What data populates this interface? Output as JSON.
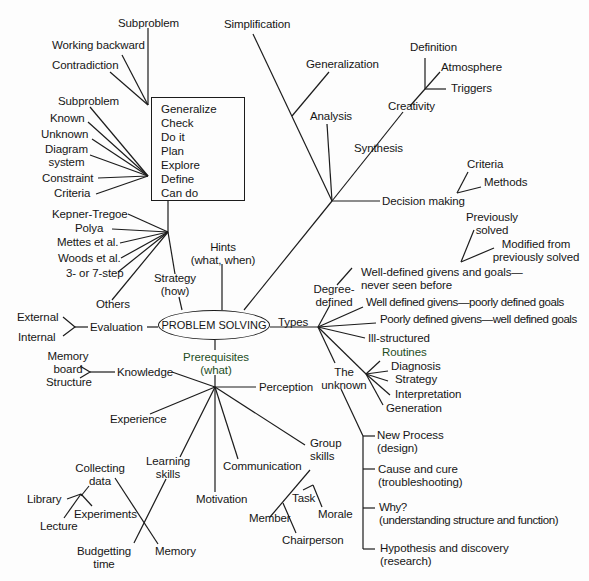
{
  "center": {
    "label": "PROBLEM SOLVING"
  },
  "strategy": {
    "label": "Strategy\n(how)",
    "label_line1": "Strategy",
    "label_line2": "(how)",
    "methods": [
      "Kepner-Tregoe",
      "Polya",
      "Mettes et al.",
      "Woods et al.",
      "3- or 7-step",
      "Others"
    ],
    "box_steps": [
      "Generalize",
      "Check",
      "Do it",
      "Plan",
      "Explore",
      "Define",
      "Can do"
    ],
    "define_inputs": [
      "Subproblem",
      "Known",
      "Unknown",
      "Diagram system",
      "Constraint",
      "Criteria"
    ],
    "define_inputs_display": {
      "diagram_line1": "Diagram",
      "diagram_line2": "system"
    },
    "explore_inputs": [
      "Subproblem",
      "Working backward",
      "Contradiction"
    ]
  },
  "hints": {
    "line1": "Hints",
    "line2": "(what, when)"
  },
  "thinking": {
    "branches": [
      "Simplification",
      "Generalization",
      "Analysis",
      "Synthesis",
      "Decision making"
    ],
    "creativity": {
      "label": "Creativity",
      "children": [
        "Definition",
        "Atmosphere",
        "Triggers"
      ]
    },
    "decision_making": {
      "label": "Decision making",
      "children": [
        "Criteria",
        "Methods"
      ]
    }
  },
  "evaluation": {
    "label": "Evaluation",
    "children": [
      "External",
      "Internal"
    ]
  },
  "types": {
    "label": "Types",
    "degree_defined": {
      "line1": "Degree-",
      "line2": "defined",
      "items": [
        "Well-defined givens and goals— never seen before",
        "Well defined givens—poorly defined goals",
        "Poorly defined givens—well defined goals",
        "Ill-structured"
      ],
      "items_display": {
        "wd_line1": "Well-defined givens and goals—",
        "wd_line2": "never seen before"
      },
      "well_defined_children": [
        "Previously solved",
        "Modified from previously solved"
      ],
      "well_defined_children_display": {
        "prev_line1": "Previously",
        "prev_line2": "solved",
        "mod_line1": "Modified from",
        "mod_line2": "previously solved"
      }
    },
    "routines": [
      "Routines",
      "Diagnosis",
      "Strategy",
      "Interpretation",
      "Generation"
    ],
    "the_unknown": {
      "line1": "The",
      "line2": "unknown",
      "items": [
        {
          "line1": "New Process",
          "line2": "(design)"
        },
        {
          "line1": "Cause and cure",
          "line2": "(troubleshooting)"
        },
        {
          "line1": "Why?",
          "line2": "(understanding structure and function)"
        },
        {
          "line1": "Hypothesis and discovery",
          "line2": "(research)"
        }
      ]
    }
  },
  "prerequisites": {
    "line1": "Prerequisites",
    "line2": "(what)",
    "knowledge": {
      "label": "Knowledge",
      "children": [
        "Memory board",
        "Structure"
      ],
      "memory_line1": "Memory",
      "memory_line2": "board"
    },
    "perception": "Perception",
    "experience": "Experience",
    "communication": "Communication",
    "motivation": "Motivation",
    "learning_skills": {
      "line1": "Learning",
      "line2": "skills",
      "collecting_data": {
        "line1": "Collecting",
        "line2": "data",
        "children": [
          "Library",
          "Experiments",
          "Lecture"
        ]
      },
      "budgetting_time": {
        "line1": "Budgetting",
        "line2": "time"
      },
      "memory": "Memory"
    },
    "group_skills": {
      "line1": "Group",
      "line2": "skills",
      "children": [
        "Task",
        "Morale",
        "Member",
        "Chairperson"
      ]
    }
  },
  "colors": {
    "ink": "#1c1c1c",
    "background": "#fdfdfd",
    "green_ink": "#1e4d1e"
  }
}
